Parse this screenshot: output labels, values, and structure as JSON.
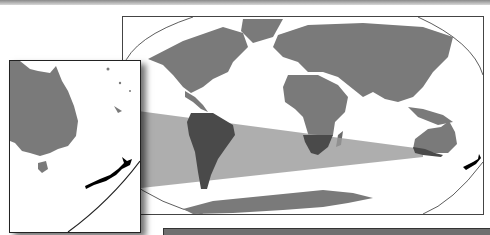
{
  "figure": {
    "colors": {
      "land": "#7a7a7a",
      "highlight_land": "#4a4a4a",
      "band": "#9a9a9a",
      "new_zealand": "#000000",
      "ocean": "#ffffff",
      "top_band": "#8a8a8a",
      "bottom_bar": "#6f6f6f"
    },
    "main_map": {
      "projection": "Robinson-like world map",
      "highlight": "New Zealand"
    },
    "inset_map": {
      "region": "Australia and New Zealand",
      "highlight": "New Zealand"
    }
  }
}
